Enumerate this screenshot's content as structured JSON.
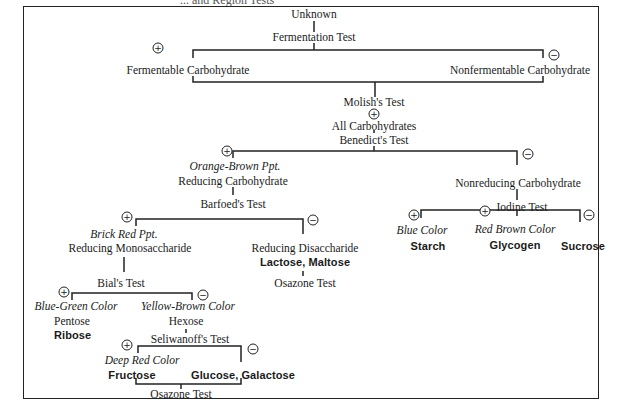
{
  "diagram": {
    "cut_title_fragment": "... and Region Tests",
    "root": "Unknown",
    "fermentation": {
      "test": "Fermentation Test",
      "positive": "Fermentable Carbohydrate",
      "negative": "Nonfermentable Carbohydrate"
    },
    "molish": {
      "test": "Molish's Test",
      "result": "All Carbohydrates"
    },
    "benedict": {
      "test": "Benedict's Test",
      "positive_observation": "Orange-Brown Ppt.",
      "positive": "Reducing Carbohydrate",
      "negative": "Nonreducing Carbohydrate"
    },
    "barfoed": {
      "test": "Barfoed's Test",
      "positive_observation": "Brick Red Ppt.",
      "positive": "Reducing Monosaccharide",
      "negative": "Reducing Disaccharide",
      "negative_examples": "Lactose, Maltose",
      "negative_next_test": "Osazone Test"
    },
    "iodine": {
      "test": "Iodine Test",
      "blue_observation": "Blue Color",
      "blue_result": "Starch",
      "red_observation": "Red Brown Color",
      "red_result": "Glycogen",
      "negative_result": "Sucrose"
    },
    "bial": {
      "test": "Bial's Test",
      "positive_observation": "Blue-Green Color",
      "positive": "Pentose",
      "positive_example": "Ribose",
      "negative_observation": "Yellow-Brown Color",
      "negative": "Hexose"
    },
    "seliwanoff": {
      "test": "Seliwanoff's Test",
      "positive_observation": "Deep Red Color",
      "positive_example": "Fructose",
      "negative_example": "Glucose, Galactose",
      "next_test": "Osazone Test"
    },
    "signs": {
      "positive": "+",
      "negative": "−"
    }
  }
}
